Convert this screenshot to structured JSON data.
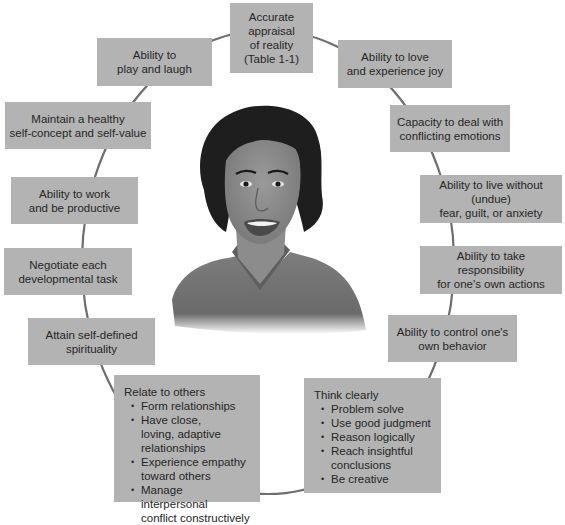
{
  "diagram": {
    "title": "",
    "colors": {
      "box_fill": "#b3b3b3",
      "text": "#262626",
      "circle_line": "#6e6e6e",
      "hair": "#1e1e1e",
      "skin": "#8a8a8a",
      "shirt": "#7a7a7a"
    },
    "center": {
      "type": "illustration",
      "description": "portrait of a smiling woman with dark curly hair wearing a V-neck shirt"
    },
    "boxes": [
      {
        "id": "reality",
        "text": "Accurate\nappraisal\nof reality\n(Table 1-1)"
      },
      {
        "id": "love",
        "text": "Ability to love\nand experience joy"
      },
      {
        "id": "conflict",
        "text": "Capacity to deal with\nconflicting emotions"
      },
      {
        "id": "fear",
        "text": "Ability to live without (undue)\nfear, guilt, or anxiety"
      },
      {
        "id": "responsibility",
        "text": "Ability to take responsibility\nfor one's own actions"
      },
      {
        "id": "control",
        "text": "Ability to control one's\nown behavior"
      },
      {
        "id": "spirituality",
        "text": "Attain self-defined\nspirituality"
      },
      {
        "id": "developmental",
        "text": "Negotiate each\ndevelopmental task"
      },
      {
        "id": "work",
        "text": "Ability to work\nand be productive"
      },
      {
        "id": "selfconcept",
        "text": "Maintain a healthy\nself-concept and self-value"
      },
      {
        "id": "play",
        "text": "Ability to\nplay and laugh"
      }
    ],
    "think": {
      "heading": "Think clearly",
      "items": [
        "Problem solve",
        "Use good judgment",
        "Reason logically",
        "Reach insightful\nconclusions",
        "Be creative"
      ]
    },
    "relate": {
      "heading": "Relate to others",
      "items": [
        "Form relationships",
        "Have close,\nloving, adaptive\nrelationships",
        "Experience empathy\ntoward others",
        "Manage interpersonal\nconflict constructively"
      ]
    }
  }
}
